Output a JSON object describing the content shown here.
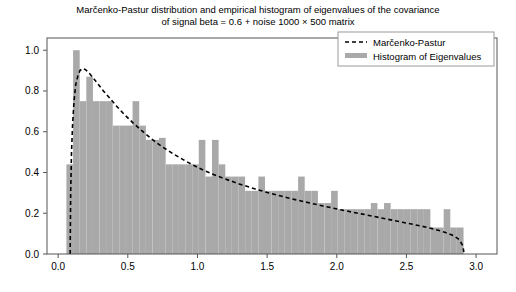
{
  "chart_data": {
    "type": "bar",
    "title": "Marčenko-Pastur distribution and empirical histogram of eigenvalues of the covariance\nof signal beta = 0.6 + noise 1000 × 500 matrix",
    "title_line1": "Marčenko-Pastur distribution and empirical histogram of eigenvalues of the covariance",
    "title_line2": "of signal beta = 0.6 + noise 1000 × 500 matrix",
    "xlabel": "",
    "ylabel": "",
    "xlim": [
      -0.08,
      3.15
    ],
    "ylim": [
      0.0,
      1.06
    ],
    "xticks": [
      0.0,
      0.5,
      1.0,
      1.5,
      2.0,
      2.5,
      3.0
    ],
    "xticklabels": [
      "0.0",
      "0.5",
      "1.0",
      "1.5",
      "2.0",
      "2.5",
      "3.0"
    ],
    "yticks": [
      0.0,
      0.2,
      0.4,
      0.6,
      0.8,
      1.0
    ],
    "yticklabels": [
      "0.0",
      "0.2",
      "0.4",
      "0.6",
      "0.8",
      "1.0"
    ],
    "grid": false,
    "legend_position": "upper right",
    "bar_color": "#a9a9a9",
    "curve_color": "#000000",
    "bar_width": 0.0475,
    "legend": [
      {
        "label": "Marčenko-Pastur",
        "type": "dashed-line",
        "color": "#000000"
      },
      {
        "label": "Histogram of Eigenvalues",
        "type": "bar",
        "color": "#a9a9a9"
      }
    ],
    "series": [
      {
        "name": "Histogram of Eigenvalues",
        "type": "bar",
        "x": [
          0.083,
          0.131,
          0.178,
          0.226,
          0.273,
          0.321,
          0.368,
          0.416,
          0.463,
          0.511,
          0.558,
          0.606,
          0.653,
          0.701,
          0.748,
          0.796,
          0.843,
          0.891,
          0.938,
          0.986,
          1.033,
          1.081,
          1.128,
          1.176,
          1.223,
          1.271,
          1.318,
          1.366,
          1.413,
          1.461,
          1.508,
          1.556,
          1.603,
          1.651,
          1.698,
          1.746,
          1.793,
          1.841,
          1.888,
          1.936,
          1.983,
          2.031,
          2.078,
          2.126,
          2.173,
          2.221,
          2.268,
          2.316,
          2.363,
          2.411,
          2.458,
          2.506,
          2.553,
          2.601,
          2.648,
          2.696,
          2.743,
          2.791,
          2.838,
          2.886
        ],
        "values": [
          0.44,
          1.0,
          0.75,
          0.87,
          0.75,
          0.75,
          0.75,
          0.63,
          0.63,
          0.63,
          0.75,
          0.63,
          0.56,
          0.56,
          0.57,
          0.44,
          0.44,
          0.44,
          0.44,
          0.44,
          0.56,
          0.38,
          0.56,
          0.44,
          0.38,
          0.38,
          0.38,
          0.31,
          0.31,
          0.38,
          0.31,
          0.31,
          0.31,
          0.31,
          0.31,
          0.38,
          0.31,
          0.31,
          0.25,
          0.25,
          0.31,
          0.22,
          0.22,
          0.22,
          0.22,
          0.22,
          0.25,
          0.22,
          0.25,
          0.22,
          0.22,
          0.22,
          0.22,
          0.22,
          0.22,
          0.13,
          0.13,
          0.22,
          0.13,
          0.13
        ]
      },
      {
        "name": "Marčenko-Pastur",
        "type": "dashed-line",
        "x": [
          0.086,
          0.09,
          0.096,
          0.104,
          0.114,
          0.126,
          0.14,
          0.156,
          0.175,
          0.196,
          0.22,
          0.25,
          0.285,
          0.325,
          0.37,
          0.42,
          0.475,
          0.535,
          0.6,
          0.67,
          0.745,
          0.825,
          0.91,
          1.0,
          1.095,
          1.195,
          1.3,
          1.41,
          1.525,
          1.645,
          1.77,
          1.9,
          2.035,
          2.175,
          2.32,
          2.47,
          2.6,
          2.7,
          2.78,
          2.84,
          2.88,
          2.905,
          2.914
        ],
        "values": [
          0.0,
          0.3,
          0.5,
          0.64,
          0.75,
          0.83,
          0.87,
          0.9,
          0.91,
          0.905,
          0.89,
          0.865,
          0.835,
          0.8,
          0.765,
          0.725,
          0.685,
          0.645,
          0.605,
          0.565,
          0.527,
          0.492,
          0.458,
          0.425,
          0.396,
          0.369,
          0.344,
          0.32,
          0.297,
          0.276,
          0.256,
          0.236,
          0.216,
          0.197,
          0.177,
          0.156,
          0.138,
          0.122,
          0.106,
          0.089,
          0.07,
          0.04,
          0.0
        ]
      }
    ]
  },
  "axes": {
    "frame_color": "#555555",
    "tick_color": "#555555"
  }
}
